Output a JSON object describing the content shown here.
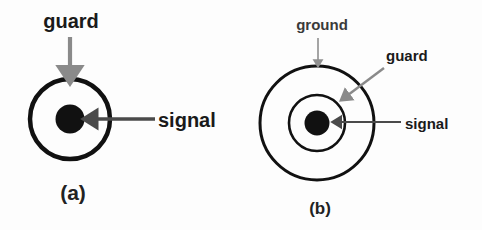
{
  "figure": {
    "background_color": "#fdfdfd"
  },
  "colors": {
    "conductor_black": "#111111",
    "ring_stroke": "#111111",
    "arrow_gray": "#8a8a8a",
    "arrow_dark": "#4a4a4a",
    "text_black": "#1a1a1a",
    "text_gray": "#3a3a3a"
  },
  "panels": [
    {
      "id": "panel-a",
      "caption": "(a)",
      "caption_x": 73,
      "caption_y": 200,
      "center": {
        "x": 70,
        "y": 119
      },
      "rings": [
        {
          "name": "guard",
          "radius": 40,
          "stroke_width": 4.5,
          "fill": "none"
        }
      ],
      "core": {
        "name": "signal",
        "radius": 14.5,
        "fill": "solid"
      },
      "labels": [
        {
          "name": "guard",
          "text": "guard",
          "style": "bold-black",
          "font_size": 20,
          "anchor": "middle",
          "x": 71,
          "y": 28,
          "arrow": {
            "style": "gray-thick-vertical",
            "from": {
              "x": 70,
              "y": 37
            },
            "to": {
              "x": 70,
              "y": 78
            }
          }
        },
        {
          "name": "signal",
          "text": "signal",
          "style": "bold-black",
          "font_size": 20,
          "anchor": "start",
          "x": 158,
          "y": 127,
          "arrow": {
            "style": "dark-horizontal",
            "from": {
              "x": 155,
              "y": 119
            },
            "to": {
              "x": 86,
              "y": 119
            }
          }
        }
      ]
    },
    {
      "id": "panel-b",
      "caption": "(b)",
      "caption_x": 320,
      "caption_y": 214,
      "center": {
        "x": 317,
        "y": 123
      },
      "rings": [
        {
          "name": "ground",
          "radius": 57,
          "stroke_width": 3.0,
          "fill": "none"
        },
        {
          "name": "guard",
          "radius": 28,
          "stroke_width": 2.6,
          "fill": "none"
        }
      ],
      "core": {
        "name": "signal",
        "radius": 12.5,
        "fill": "solid"
      },
      "labels": [
        {
          "name": "ground",
          "text": "ground",
          "style": "bold-gray",
          "font_size": 15,
          "anchor": "middle",
          "x": 322,
          "y": 30,
          "arrow": {
            "style": "gray-thin-vertical",
            "from": {
              "x": 318,
              "y": 38
            },
            "to": {
              "x": 318,
              "y": 66
            }
          }
        },
        {
          "name": "guard",
          "text": "guard",
          "style": "bold-black",
          "font_size": 15,
          "anchor": "start",
          "x": 386,
          "y": 61,
          "arrow": {
            "style": "gray-diagonal",
            "from": {
              "x": 384,
              "y": 68
            },
            "to": {
              "x": 341,
              "y": 100
            }
          }
        },
        {
          "name": "signal",
          "text": "signal",
          "style": "bold-black",
          "font_size": 15,
          "anchor": "start",
          "x": 405,
          "y": 129,
          "arrow": {
            "style": "dark-horizontal",
            "from": {
              "x": 401,
              "y": 122
            },
            "to": {
              "x": 333,
              "y": 122
            }
          }
        }
      ]
    }
  ]
}
